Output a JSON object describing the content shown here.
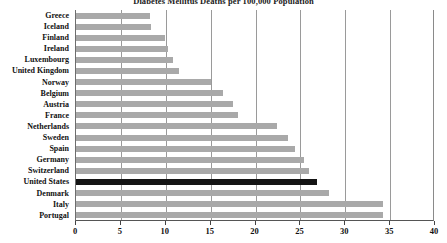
{
  "chart_data": {
    "type": "bar",
    "orientation": "horizontal",
    "title": "Diabetes Mellitus Deaths per 100,000 Population",
    "xlabel": "",
    "ylabel": "",
    "xlim": [
      0,
      40
    ],
    "xticks": [
      0,
      5,
      10,
      15,
      20,
      25,
      30,
      35,
      40
    ],
    "grid": "vertical",
    "legend": "none",
    "bar_color": "#a9a9a9",
    "highlight_color": "#141414",
    "highlight_category": "United States",
    "categories": [
      "Greece",
      "Iceland",
      "Finland",
      "Ireland",
      "Luxembourg",
      "United Kingdom",
      "Norway",
      "Belgium",
      "Austria",
      "France",
      "Netherlands",
      "Sweden",
      "Spain",
      "Germany",
      "Switzerland",
      "United States",
      "Denmark",
      "Italy",
      "Portugal"
    ],
    "values": [
      8.2,
      8.4,
      9.9,
      10.3,
      10.8,
      11.5,
      15.0,
      16.4,
      17.5,
      18.0,
      22.4,
      23.6,
      24.4,
      25.4,
      26.0,
      26.8,
      28.2,
      34.2,
      34.2
    ]
  }
}
